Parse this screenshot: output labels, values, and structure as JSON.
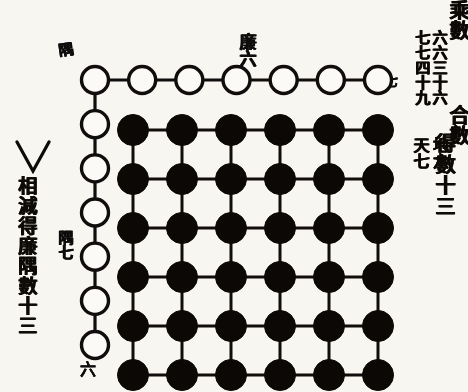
{
  "diagram": {
    "title_left": "乘數",
    "left_columns": [
      {
        "text": "六六三十六",
        "meaning_digits": "6 × 6 = 36"
      },
      {
        "text": "七七四十九",
        "meaning_digits": "7 × 7 = 49"
      }
    ],
    "operator_symbol": "V",
    "left_note": "相減得廉隅數十三",
    "title_right": "合數",
    "right_columns": [
      {
        "text": "地六"
      },
      {
        "text": "天七"
      }
    ],
    "right_result": "得數十三",
    "annotations": {
      "lian_six": "廉六",
      "yu_top": "隅",
      "yu_mid": "隅七",
      "six_bottom": "六",
      "right_edge": "七"
    }
  },
  "chart_data": {
    "type": "scatter",
    "xlabel": "",
    "ylabel": "",
    "grid": true,
    "legend_position": "none",
    "series": [
      {
        "name": "方 (square of filled counters, 6×6 = 36)",
        "marker": "filled-circle",
        "color": "#100d0a",
        "rows": 6,
        "cols": 6,
        "count": 36,
        "x": [
          0,
          1,
          2,
          3,
          4,
          5
        ],
        "y": [
          0,
          1,
          2,
          3,
          4,
          5
        ]
      },
      {
        "name": "廉 (top row of open counters, 6)",
        "marker": "open-circle",
        "color": "#ffffff",
        "count": 6,
        "orientation": "horizontal"
      },
      {
        "name": "廉 (left column of open counters, 6)",
        "marker": "open-circle",
        "color": "#ffffff",
        "count": 6,
        "orientation": "vertical"
      },
      {
        "name": "隅 (shared corner counter, 1)",
        "marker": "open-circle",
        "color": "#ffffff",
        "count": 1
      }
    ],
    "totals": {
      "square_36": 36,
      "larger_square_49": 49,
      "lian_yu_difference": 13,
      "lian_each": 6,
      "yu": 1
    },
    "annotations": [
      {
        "label": "廉六",
        "position": "above top row, center"
      },
      {
        "label": "隅",
        "position": "top-left corner counter"
      },
      {
        "label": "隅七",
        "position": "left column, fifth counter"
      },
      {
        "label": "六",
        "position": "below bottom-left counter"
      },
      {
        "label": "七",
        "position": "right of top row end"
      }
    ]
  }
}
